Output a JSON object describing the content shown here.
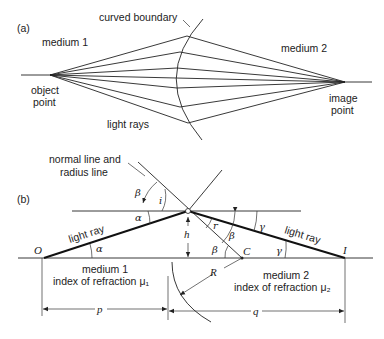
{
  "part_a": {
    "label": "(a)",
    "boundary_label": "curved boundary",
    "medium_left": "medium 1",
    "medium_right": "medium 2",
    "object_point": [
      "object",
      "point"
    ],
    "image_point": [
      "image",
      "point"
    ],
    "rays_label": "light rays"
  },
  "part_b": {
    "label": "(b)",
    "normal_label": [
      "normal line and",
      "radius line"
    ],
    "ray_left": "light ray",
    "ray_right": "light ray",
    "point_O": "O",
    "point_I": "I",
    "point_C": "C",
    "height": "h",
    "radius": "R",
    "medium_left": [
      "medium 1",
      "index of refraction μ₁"
    ],
    "medium_right": [
      "medium 2",
      "index of refraction μ₂"
    ],
    "dist_p": "p",
    "dist_q": "q",
    "angles": {
      "alpha_upper": "α",
      "alpha_lower": "α",
      "beta_upper": "β",
      "incidence": "i",
      "refraction": "r",
      "beta_right": "β",
      "beta_center": "β",
      "gamma_upper": "γ",
      "gamma_lower": "γ"
    }
  }
}
